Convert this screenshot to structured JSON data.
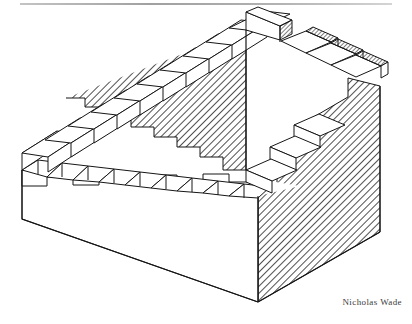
{
  "figure": {
    "credit": "Nicholas Wade",
    "type": "line-drawing",
    "medium": "pen-and-ink hatched line illustration",
    "background_color": "#ffffff",
    "ink_color": "#1a1a1a",
    "hatch_color": "#1a1a1a",
    "scan_artifact": {
      "name": "horizontal-scan-line",
      "color": "#9a9a9a",
      "position": "top edge"
    },
    "parts": {
      "left_staircase_label": "ascending left flight",
      "front_row_label": "front tread row",
      "right_staircase_label": "descending right flight",
      "front_face_label": "white front face",
      "right_face_label": "hatched right face",
      "inner_wall_label": "hatched inner wall"
    },
    "counts": {
      "left_ascending_steps": 9,
      "front_row_treads": 9,
      "right_descending_steps": 6
    }
  }
}
